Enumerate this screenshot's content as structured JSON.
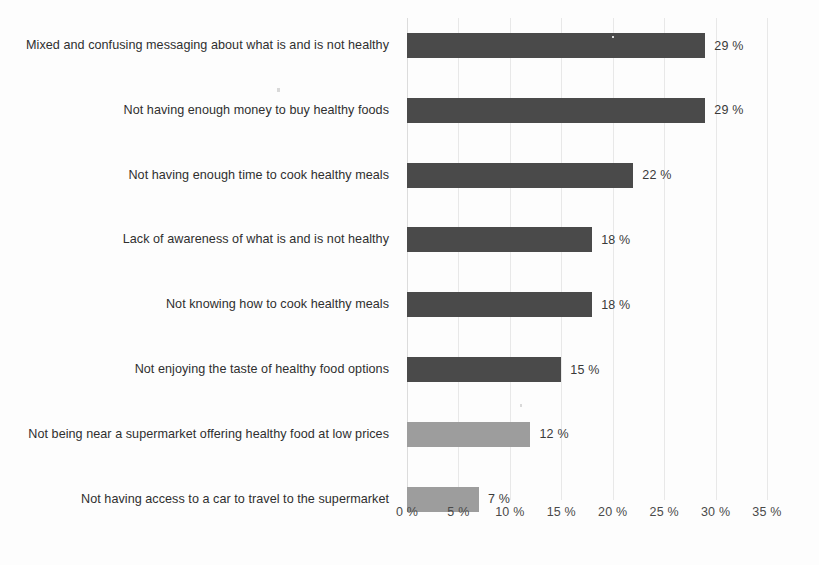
{
  "chart_data": {
    "type": "bar",
    "orientation": "horizontal",
    "title": "",
    "subtitle": "",
    "xlabel": "",
    "ylabel": "",
    "xlim": [
      0,
      35
    ],
    "grid": true,
    "legend": null,
    "value_suffix": " %",
    "categories": [
      "Mixed and confusing messaging about what is and is not healthy",
      "Not having enough money to buy healthy foods",
      "Not having enough time to cook healthy meals",
      "Lack of awareness of what is and is not healthy",
      "Not knowing how to cook healthy meals",
      "Not enjoying the taste of healthy food options",
      "Not being near a supermarket offering healthy food at low prices",
      "Not having access to a car to travel to the supermarket"
    ],
    "values": [
      29,
      29,
      22,
      18,
      18,
      15,
      12,
      7
    ],
    "value_labels": [
      "29 %",
      "29 %",
      "22 %",
      "18 %",
      "18 %",
      "15 %",
      "12 %",
      "7 %"
    ],
    "bar_colors": [
      "#4a4a4a",
      "#4a4a4a",
      "#4a4a4a",
      "#4a4a4a",
      "#4a4a4a",
      "#4a4a4a",
      "#9d9d9d",
      "#9d9d9d"
    ],
    "xticks": [
      0,
      5,
      10,
      15,
      20,
      25,
      30,
      35
    ],
    "xtick_labels": [
      "0 %",
      "5 %",
      "10 %",
      "15 %",
      "20 %",
      "25 %",
      "30 %",
      "35 %"
    ]
  },
  "bars": [
    {
      "label": "Mixed and confusing messaging about what is and is not healthy",
      "value": 29,
      "value_label": "29 %",
      "tone": "dark"
    },
    {
      "label": "Not having enough money to buy healthy foods",
      "value": 29,
      "value_label": "29 %",
      "tone": "dark"
    },
    {
      "label": "Not having enough time to cook healthy meals",
      "value": 22,
      "value_label": "22 %",
      "tone": "dark"
    },
    {
      "label": "Lack of awareness of what is and is not healthy",
      "value": 18,
      "value_label": "18 %",
      "tone": "dark"
    },
    {
      "label": "Not knowing how to cook healthy meals",
      "value": 18,
      "value_label": "18 %",
      "tone": "dark"
    },
    {
      "label": "Not enjoying the taste of healthy food options",
      "value": 15,
      "value_label": "15 %",
      "tone": "dark"
    },
    {
      "label": "Not being near a supermarket offering healthy food at low prices",
      "value": 12,
      "value_label": "12 %",
      "tone": "light"
    },
    {
      "label": "Not having access to a car to travel to the supermarket",
      "value": 7,
      "value_label": "7 %",
      "tone": "light"
    }
  ],
  "axis": {
    "ticks": [
      {
        "value": 0,
        "label": "0 %"
      },
      {
        "value": 5,
        "label": "5 %"
      },
      {
        "value": 10,
        "label": "10 %"
      },
      {
        "value": 15,
        "label": "15 %"
      },
      {
        "value": 20,
        "label": "20 %"
      },
      {
        "value": 25,
        "label": "25 %"
      },
      {
        "value": 30,
        "label": "30 %"
      },
      {
        "value": 35,
        "label": "35 %"
      }
    ]
  },
  "colors": {
    "bar_dark": "#4a4a4a",
    "bar_light": "#9d9d9d",
    "gridline": "#e8e8e8",
    "text": "#2f2f2f",
    "background": "#fdfdfd"
  }
}
